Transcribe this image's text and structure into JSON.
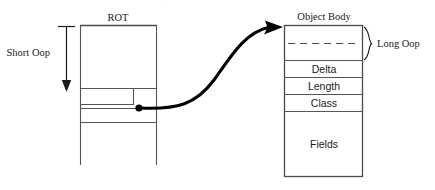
{
  "diagram": {
    "type": "memory-layout-diagram",
    "cut_off_top_text": "- + - -",
    "rot": {
      "title": "ROT",
      "geometry": {
        "x": 80,
        "y": 25,
        "width": 77,
        "open_bottom_y": 165
      },
      "dividers_y": [
        88,
        108,
        122
      ],
      "inner_box": {
        "x": 80,
        "y": 88,
        "width": 54,
        "height": 16
      },
      "pointer_dot": {
        "x": 139,
        "y": 108
      }
    },
    "short_oop": {
      "label": "Short Oop",
      "arrow": {
        "x": 66,
        "from_y": 27,
        "to_y": 90
      }
    },
    "connector": {
      "name": "pointer-arrow",
      "from": {
        "x": 139,
        "y": 108
      },
      "to": {
        "x": 283,
        "y": 27
      }
    },
    "object_body": {
      "title": "Object Body",
      "geometry": {
        "x": 284,
        "y": 25,
        "width": 79,
        "height": 152
      },
      "cells": [
        {
          "label": "",
          "name": "header-cell-upper",
          "height": 18
        },
        {
          "label": "",
          "name": "header-cell-lower",
          "height": 17
        },
        {
          "label": "Delta",
          "name": "delta-cell",
          "height": 17
        },
        {
          "label": "Length",
          "name": "length-cell",
          "height": 17
        },
        {
          "label": "Class",
          "name": "class-cell",
          "height": 17
        },
        {
          "label": "Fields",
          "name": "fields-cell",
          "height": 66
        }
      ],
      "dashed_divider_y": 43
    },
    "long_oop": {
      "label": "Long Oop",
      "brace": {
        "x": 367,
        "top_y": 27,
        "bottom_y": 60
      }
    }
  },
  "colors": {
    "box_stroke": "#555555",
    "text": "#1a1a1a",
    "arrow": "#000000",
    "background": "#ffffff",
    "cut_text": "#e2e2e2"
  }
}
